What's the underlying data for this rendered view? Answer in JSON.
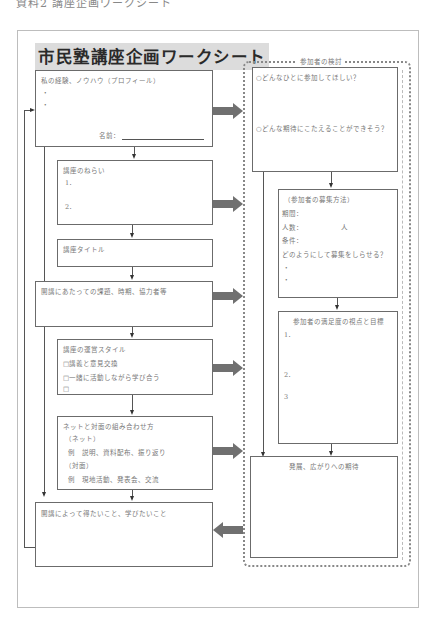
{
  "caption": "資料2 講座企画ワークシート",
  "title": "市民塾講座企画ワークシート",
  "left_column": {
    "profile": {
      "heading": "私の経験、ノウハウ（プロフィール）",
      "bullets": [
        "・",
        "・"
      ],
      "name_label": "名前："
    },
    "aims": {
      "heading": "講座のねらい",
      "items": [
        "1．",
        "2．"
      ]
    },
    "course_title": {
      "heading": "講座タイトル"
    },
    "issues": {
      "heading": "開講にあたっての課題、時期、協力者等"
    },
    "style": {
      "heading": "講座の運営スタイル",
      "options": [
        "□講義と意見交換",
        "□一緒に活動しながら学び合う",
        "□"
      ]
    },
    "blend": {
      "heading": "ネットと対面の組み合わせ方",
      "net_label": "（ネット）",
      "net_example": "例　説明、資料配布、振り返り",
      "face_label": "（対面）",
      "face_example": "例　現地活動、発表会、交流"
    },
    "gain": {
      "heading": "開講によって得たいこと、学びたいこと"
    }
  },
  "right_column": {
    "panel_label": "参加者の検討",
    "target": {
      "q1": "○どんなひとに参加してほしい？",
      "q2": "○どんな期待にこたえることができそう？"
    },
    "recruit": {
      "heading": "（参加者の募集方法）",
      "period_label": "期間：",
      "count_label": "人数：",
      "count_unit": "人",
      "condition_label": "条件：",
      "how_question": "どのようにして募集をしらせる？",
      "bullets": [
        "・",
        "・"
      ]
    },
    "satisfaction": {
      "heading": "参加者の満足度の視点と目標",
      "items": [
        "1．",
        "2．",
        "3"
      ]
    },
    "expectation": {
      "heading": "発展、広がりへの期待"
    }
  },
  "colors": {
    "box_border": "#6b6b6b",
    "fat_arrow": "#707070",
    "title_bg": "#dcdcdc",
    "text": "#777777"
  }
}
